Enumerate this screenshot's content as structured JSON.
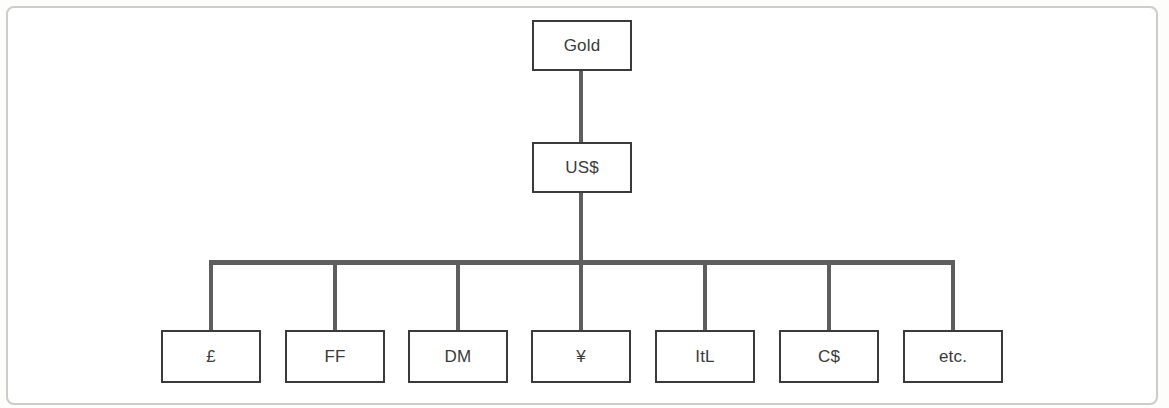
{
  "diagram": {
    "type": "hierarchy-tree",
    "root": {
      "label": "Gold"
    },
    "intermediate": {
      "label": "US$"
    },
    "children": [
      {
        "label": "£"
      },
      {
        "label": "FF"
      },
      {
        "label": "DM"
      },
      {
        "label": "¥"
      },
      {
        "label": "ItL"
      },
      {
        "label": "C$"
      },
      {
        "label": "etc."
      }
    ],
    "structure": {
      "edges": [
        [
          "Gold",
          "US$"
        ],
        [
          "US$",
          "£"
        ],
        [
          "US$",
          "FF"
        ],
        [
          "US$",
          "DM"
        ],
        [
          "US$",
          "¥"
        ],
        [
          "US$",
          "ItL"
        ],
        [
          "US$",
          "C$"
        ],
        [
          "US$",
          "etc."
        ]
      ]
    },
    "colors": {
      "connector": "#5e5e5e",
      "box_border": "#3a3a3a",
      "frame_border": "#cccccb",
      "background": "#ffffff",
      "text": "#3a3a3a"
    }
  }
}
